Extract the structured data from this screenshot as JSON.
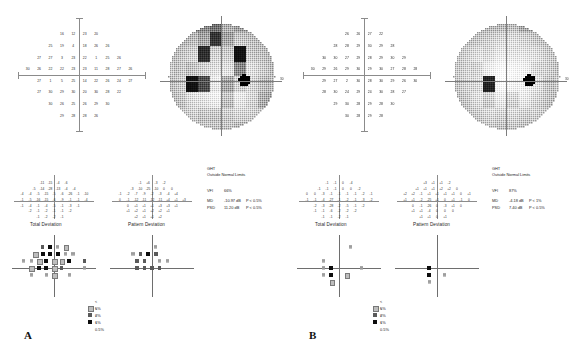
{
  "figure": {
    "type": "visual-field-printout-pair",
    "panels": [
      {
        "letter": "A",
        "sensitivity_title": "",
        "sensitivity_values": [
          [
            null,
            null,
            null,
            16,
            12,
            23,
            20,
            null,
            null,
            null
          ],
          [
            null,
            null,
            25,
            19,
            4,
            18,
            26,
            26,
            null,
            null
          ],
          [
            null,
            27,
            27,
            3,
            23,
            22,
            1,
            25,
            26,
            null
          ],
          [
            30,
            26,
            22,
            22,
            23,
            23,
            11,
            28,
            27,
            26
          ],
          [
            null,
            27,
            1,
            5,
            25,
            14,
            22,
            26,
            24,
            27
          ],
          [
            null,
            27,
            30,
            29,
            30,
            20,
            30,
            28,
            22,
            null
          ],
          [
            null,
            null,
            30,
            26,
            25,
            26,
            29,
            30,
            null,
            null
          ],
          [
            null,
            null,
            null,
            29,
            28,
            28,
            26,
            null,
            null,
            null
          ]
        ],
        "grayscale_left_label": "",
        "grayscale_right_label": "30",
        "total_deviation_title": "Total Deviation",
        "total_deviation_values": [
          [
            null,
            null,
            "-11",
            "-15",
            "-4",
            "-6",
            null,
            null
          ],
          [
            null,
            "-5",
            "-14",
            "-28",
            "-13",
            "-4",
            "-4",
            null
          ],
          [
            "-4",
            "-4",
            "-5",
            "-15",
            "-5",
            "-6",
            "-26",
            "-1",
            "-10"
          ],
          [
            "-1",
            "-5",
            "-16",
            "-15",
            "-6",
            "-9",
            "-1",
            "-1",
            "-4"
          ],
          [
            "-1",
            "-4",
            "-1",
            "-4",
            "-5",
            "-1",
            "-3",
            "-1",
            null
          ],
          [
            null,
            "-2",
            "-1",
            "-2",
            "-1",
            "-1",
            "-2",
            null,
            null
          ],
          [
            null,
            null,
            "-1",
            "-2",
            "-2",
            "-1",
            null,
            null,
            null
          ]
        ],
        "pattern_deviation_title": "Pattern Deviation",
        "pattern_deviation_values": [
          [
            null,
            null,
            "-1",
            "+6",
            "-3",
            "-2",
            null,
            null
          ],
          [
            null,
            "-3",
            "-10",
            "-25",
            "-10",
            "0",
            "0",
            null
          ],
          [
            "-1",
            "-2",
            "-7",
            "-9",
            "-2",
            "-3",
            "-4",
            "+4",
            null
          ],
          [
            "0",
            "-1",
            "-12",
            "-11",
            "-12",
            "-11",
            "+4",
            "+1",
            "+3"
          ],
          [
            null,
            "0",
            "+1",
            "+1",
            "+1",
            "+3",
            "+3",
            "+1",
            null
          ],
          [
            null,
            "+1",
            "+2",
            "+1",
            "+2",
            "+2",
            "+1",
            null,
            null
          ],
          [
            null,
            null,
            "+2",
            "+1",
            "+1",
            "+2",
            null,
            null,
            null
          ]
        ],
        "stats": {
          "ght_label": "GHT",
          "ght_value": "Outside Normal Limits",
          "vfi_label": "VFI",
          "vfi_value": "66%",
          "md_label": "MD",
          "md_value": "-10.97 dB",
          "md_p": "P < 0.5%",
          "psd_label": "PSD",
          "psd_value": "11.20 dB",
          "psd_p": "P < 0.5%"
        },
        "legend": [
          {
            "symbol": "stipple",
            "label": "< 5%"
          },
          {
            "symbol": "hatch",
            "label": "< 2%"
          },
          {
            "symbol": "dark",
            "label": "< 1%"
          },
          {
            "symbol": "solid",
            "label": "< 0.5%"
          }
        ]
      },
      {
        "letter": "B",
        "sensitivity_title": "",
        "sensitivity_values": [
          [
            null,
            null,
            null,
            26,
            26,
            27,
            22,
            null,
            null,
            null
          ],
          [
            null,
            null,
            28,
            28,
            29,
            30,
            29,
            28,
            null,
            null
          ],
          [
            null,
            30,
            30,
            27,
            29,
            28,
            29,
            30,
            29,
            null
          ],
          [
            30,
            29,
            26,
            29,
            30,
            29,
            30,
            27,
            28,
            28
          ],
          [
            null,
            29,
            27,
            2,
            30,
            28,
            30,
            29,
            26,
            30
          ],
          [
            null,
            28,
            30,
            24,
            29,
            24,
            30,
            28,
            27,
            null
          ],
          [
            null,
            null,
            29,
            30,
            28,
            29,
            28,
            30,
            null,
            null
          ],
          [
            null,
            null,
            null,
            30,
            28,
            29,
            28,
            null,
            null,
            null
          ]
        ],
        "grayscale_left_label": "",
        "grayscale_right_label": "30",
        "total_deviation_title": "Total Deviation",
        "total_deviation_values": [
          [
            null,
            null,
            "-1",
            "-1",
            "0",
            "-4",
            null,
            null
          ],
          [
            null,
            "-1",
            "-1",
            "-1",
            "0",
            "0",
            "-2",
            null
          ],
          [
            "0",
            "0",
            "-3",
            "-1",
            "-1",
            "-1",
            "-1",
            "-2",
            "-1"
          ],
          [
            "-1",
            "-1",
            "-4",
            "-27",
            "-1",
            "-2",
            "-1",
            "-3",
            "-2"
          ],
          [
            null,
            "-2",
            "-3",
            "-28",
            "-2",
            "-5",
            "-1",
            "-2",
            null
          ],
          [
            null,
            "-1",
            "-1",
            "-6",
            "-2",
            "-2",
            "-2",
            null,
            null
          ],
          [
            null,
            null,
            "-1",
            "-1",
            "-2",
            "-1",
            null,
            null,
            null
          ]
        ],
        "pattern_deviation_title": "Pattern Deviation",
        "pattern_deviation_values": [
          [
            null,
            null,
            "+3",
            "+1",
            "+1",
            "-2",
            null,
            null
          ],
          [
            null,
            "+1",
            "+1",
            "+1",
            "+2",
            "+2",
            "0",
            null
          ],
          [
            "+2",
            "+2",
            "-1",
            "+1",
            "+1",
            "+1",
            "+1",
            "0",
            "+1"
          ],
          [
            "+1",
            "+1",
            "-2",
            "-25",
            "+1",
            "0",
            "+1",
            "-1",
            "0"
          ],
          [
            null,
            "0",
            "-1",
            "-26",
            "0",
            "-3",
            "+1",
            "0",
            null
          ],
          [
            null,
            "+1",
            "+1",
            "-4",
            "0",
            "0",
            "0",
            null,
            null
          ],
          [
            null,
            null,
            "+1",
            "+1",
            "0",
            "+1",
            null,
            null,
            null
          ]
        ],
        "stats": {
          "ght_label": "GHT",
          "ght_value": "Outside Normal Limits",
          "vfi_label": "VFI",
          "vfi_value": "87%",
          "md_label": "MD",
          "md_value": "-4.18 dB",
          "md_p": "P < 1%",
          "psd_label": "PSD",
          "psd_value": "7.40 dB",
          "psd_p": "P < 0.5%"
        },
        "legend": [
          {
            "symbol": "stipple",
            "label": "< 5%"
          },
          {
            "symbol": "hatch",
            "label": "< 2%"
          },
          {
            "symbol": "dark",
            "label": "< 1%"
          },
          {
            "symbol": "solid",
            "label": "< 0.5%"
          }
        ]
      }
    ]
  },
  "chart_data": {
    "type": "heatmap",
    "units": "decibels (dB)",
    "panels": [
      "A",
      "B"
    ],
    "series": [
      {
        "name": "A sensitivity (dB)",
        "values": [
          16,
          12,
          23,
          20,
          25,
          19,
          4,
          18,
          26,
          26,
          27,
          27,
          3,
          23,
          22,
          1,
          25,
          26,
          30,
          26,
          22,
          22,
          23,
          23,
          11,
          28,
          27,
          26,
          27,
          1,
          5,
          25,
          14,
          22,
          26,
          24,
          27,
          27,
          30,
          29,
          30,
          20,
          30,
          28,
          22,
          30,
          26,
          25,
          26,
          29,
          30,
          29,
          28,
          28,
          26
        ]
      },
      {
        "name": "B sensitivity (dB)",
        "values": [
          26,
          26,
          27,
          22,
          28,
          28,
          29,
          30,
          29,
          28,
          30,
          30,
          27,
          29,
          28,
          29,
          30,
          29,
          30,
          29,
          26,
          29,
          30,
          29,
          30,
          27,
          28,
          28,
          29,
          27,
          2,
          30,
          28,
          30,
          29,
          26,
          30,
          28,
          30,
          24,
          29,
          24,
          30,
          28,
          27,
          29,
          30,
          28,
          29,
          28,
          30,
          30,
          28,
          29,
          28
        ]
      }
    ],
    "summary_metrics": [
      {
        "panel": "A",
        "GHT": "Outside Normal Limits",
        "VFI": "66%",
        "MD": -10.97,
        "MD_p": "P < 0.5%",
        "PSD": 11.2,
        "PSD_p": "P < 0.5%"
      },
      {
        "panel": "B",
        "GHT": "Outside Normal Limits",
        "VFI": "87%",
        "MD": -4.18,
        "MD_p": "P < 1%",
        "PSD": 7.4,
        "PSD_p": "P < 0.5%"
      }
    ],
    "legend": [
      "< 5%",
      "< 2%",
      "< 1%",
      "< 0.5%"
    ],
    "legend_position": "bottom-center-of-each-panel",
    "grid": false
  }
}
